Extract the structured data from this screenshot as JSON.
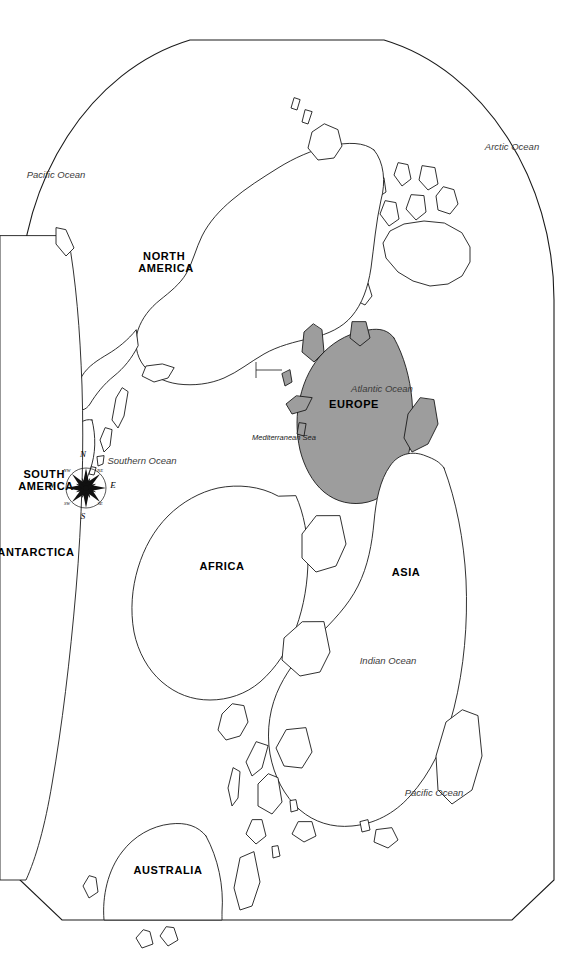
{
  "map": {
    "title": "World Map",
    "projection": "robinson-oval",
    "orientation_deg": 90,
    "background_color": "#ffffff",
    "land_fill_color": "#ffffff",
    "land_stroke_color": "#1a1a1a",
    "highlight_fill_color": "#9d9d9d",
    "highlighted_region": "EUROPE",
    "continents": [
      {
        "id": "north-america",
        "label": "NORTH AMERICA",
        "lines": [
          "NORTH",
          "AMERICA"
        ]
      },
      {
        "id": "south-america",
        "label": "SOUTH AMERICA",
        "lines": [
          "SOUTH",
          "AMERICA"
        ]
      },
      {
        "id": "europe",
        "label": "EUROPE",
        "lines": [
          "EUROPE"
        ],
        "highlighted": true
      },
      {
        "id": "africa",
        "label": "AFRICA",
        "lines": [
          "AFRICA"
        ]
      },
      {
        "id": "asia",
        "label": "ASIA",
        "lines": [
          "ASIA"
        ]
      },
      {
        "id": "australia",
        "label": "AUSTRALIA",
        "lines": [
          "AUSTRALIA"
        ]
      },
      {
        "id": "antarctica",
        "label": "ANTARCTICA",
        "lines": [
          "ANTARCTICA"
        ]
      }
    ],
    "oceans": [
      {
        "id": "arctic-ocean",
        "label": "Arctic Ocean"
      },
      {
        "id": "atlantic-ocean",
        "label": "Atlantic Ocean"
      },
      {
        "id": "pacific-ocean-east",
        "label": "Pacific Ocean"
      },
      {
        "id": "pacific-ocean-west",
        "label": "Pacific Ocean"
      },
      {
        "id": "indian-ocean",
        "label": "Indian Ocean"
      },
      {
        "id": "southern-ocean",
        "label": "Southern Ocean"
      }
    ],
    "seas": [
      {
        "id": "mediterranean-sea",
        "label": "Mediterranean Sea",
        "has_leader_line": true
      }
    ]
  },
  "compass": {
    "name": "compass-rose",
    "cardinals": {
      "north": "N",
      "south": "S",
      "east": "E",
      "west": "W"
    },
    "intercardinals": {
      "northeast": "NE",
      "northwest": "NW",
      "southeast": "SE",
      "southwest": "SW"
    }
  }
}
